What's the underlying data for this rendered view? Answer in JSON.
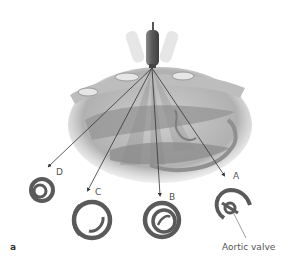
{
  "figure": {
    "panel_label": "a",
    "probe": {
      "name": "transducer-probe",
      "color": "#6e6e6e"
    },
    "views": [
      {
        "id": "A",
        "label": "A"
      },
      {
        "id": "B",
        "label": "B"
      },
      {
        "id": "C",
        "label": "C"
      },
      {
        "id": "D",
        "label": "D"
      }
    ],
    "annotations": {
      "aortic_valve": "Aortic valve"
    },
    "colors": {
      "heart_fill": "#a9a9a9",
      "ring": "#5a5a5a",
      "beam_line": "#333333",
      "background": "#ffffff"
    }
  }
}
